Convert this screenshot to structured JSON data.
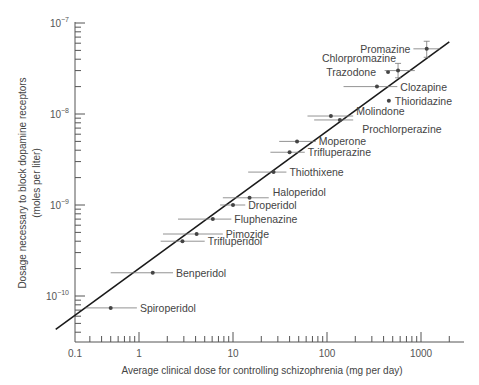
{
  "chart_data": {
    "type": "scatter",
    "title": "",
    "xlabel": "Average clinical dose for controlling schizophrenia (mg per day)",
    "ylabel": "Dosage necessary to block dopamine receptors",
    "ylabel_units": "(moles per liter)",
    "xscale": "log",
    "yscale": "log",
    "xlim": [
      0.1,
      3000
    ],
    "ylim": [
      4e-11,
      1e-07
    ],
    "x_tick_labels": [
      "0.1",
      "1",
      "10",
      "100",
      "1000"
    ],
    "x_tick_values": [
      0.1,
      1,
      10,
      100,
      1000
    ],
    "y_tick_labels": [
      {
        "base": "10",
        "exp": "−7",
        "value": 1e-07
      },
      {
        "base": "10",
        "exp": "−8",
        "value": 1e-08
      },
      {
        "base": "10",
        "exp": "−9",
        "value": 1e-09
      },
      {
        "base": "10",
        "exp": "−10",
        "value": 1e-10
      }
    ],
    "grid": false,
    "regression_line": {
      "x": [
        0.13,
        2000
      ],
      "y": [
        4.3e-11,
        6.2e-08
      ]
    },
    "points": [
      {
        "name": "Spiroperidol",
        "x": 0.5,
        "y": 7.4e-11,
        "xerr": [
          0.27,
          0.95
        ],
        "label_side": "right"
      },
      {
        "name": "Benperidol",
        "x": 1.4,
        "y": 1.8e-10,
        "xerr": [
          0.5,
          2.3
        ],
        "label_side": "right"
      },
      {
        "name": "Trifluperidol",
        "x": 2.9,
        "y": 4e-10,
        "xerr": [
          1.7,
          5.0
        ],
        "label_side": "right"
      },
      {
        "name": "Pimozide",
        "x": 4.1,
        "y": 4.8e-10,
        "xerr": [
          1.8,
          7.8
        ],
        "label_side": "right"
      },
      {
        "name": "Fluphenazine",
        "x": 6.1,
        "y": 7e-10,
        "xerr": [
          2.6,
          9.6
        ],
        "label_side": "right"
      },
      {
        "name": "Droperidol",
        "x": 10,
        "y": 1e-09,
        "xerr": [
          7.3,
          13.5
        ],
        "label_side": "right"
      },
      {
        "name": "Haloperidol",
        "x": 15,
        "y": 1.2e-09,
        "xerr": [
          7.8,
          24
        ],
        "label_side": "right"
      },
      {
        "name": "Thiothixene",
        "x": 27,
        "y": 2.3e-09,
        "xerr": [
          14.5,
          37
        ],
        "label_side": "right"
      },
      {
        "name": "Trifluperazine",
        "x": 40,
        "y": 3.8e-09,
        "xerr": [
          25,
          58
        ],
        "label_side": "right"
      },
      {
        "name": "Moperone",
        "x": 48,
        "y": 5e-09,
        "xerr": [
          31,
          76
        ],
        "label_side": "right"
      },
      {
        "name": "Molindone",
        "x": 110,
        "y": 9.5e-09,
        "xerr": [
          62,
          190
        ],
        "label_side": "right"
      },
      {
        "name": "Prochlorperazine",
        "x": 137,
        "y": 8.6e-09,
        "xerr": [
          73,
          190
        ],
        "label_side": "right"
      },
      {
        "name": "Thioridazine",
        "x": 455,
        "y": 1.4e-08,
        "xerr": null,
        "label_side": "right"
      },
      {
        "name": "Clozapine",
        "x": 340,
        "y": 2e-08,
        "xerr": [
          150,
          560
        ],
        "label_side": "right"
      },
      {
        "name": "Trazodone",
        "x": 446,
        "y": 2.9e-08,
        "xerr": null,
        "label_side": "left"
      },
      {
        "name": "Chlorpromazine",
        "x": 570,
        "y": 3e-08,
        "xerr": [
          410,
          860
        ],
        "yerr": [
          2.5e-08,
          3.6e-08
        ],
        "label_side": "left"
      },
      {
        "name": "Promazine",
        "x": 1150,
        "y": 5.2e-08,
        "xerr": [
          830,
          1600
        ],
        "yerr": [
          4.2e-08,
          6.3e-08
        ],
        "label_side": "left"
      }
    ]
  }
}
